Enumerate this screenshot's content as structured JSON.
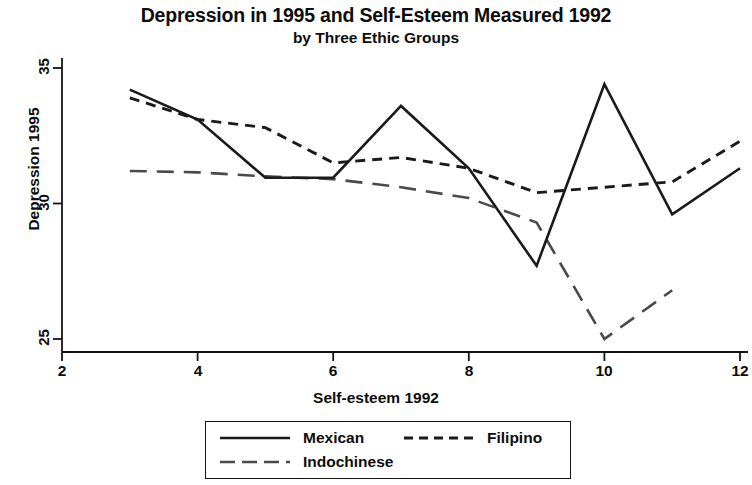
{
  "chart_data": {
    "type": "line",
    "title": "Depression in 1995 and Self-Esteem Measured 1992",
    "subtitle": "by Three Ethic Groups",
    "xlabel": "Self-esteem 1992",
    "ylabel": "Depression 1995",
    "xlim": [
      2,
      12
    ],
    "ylim": [
      24.1,
      35.2
    ],
    "xticks": [
      2,
      4,
      6,
      8,
      10,
      12
    ],
    "yticks": [
      25,
      30,
      35
    ],
    "grid": false,
    "legend_position": "below-axes",
    "series": [
      {
        "name": "Mexican",
        "style": "solid",
        "color": "#1a1a1a",
        "x": [
          3,
          4,
          5,
          6,
          7,
          8,
          9,
          10,
          11,
          12
        ],
        "values": [
          34.2,
          33.1,
          30.95,
          30.95,
          33.6,
          31.3,
          27.7,
          34.4,
          29.6,
          31.3
        ]
      },
      {
        "name": "Filipino",
        "style": "dashed-short",
        "color": "#1a1a1a",
        "x": [
          3,
          4,
          5,
          6,
          7,
          8,
          9,
          10,
          11,
          12
        ],
        "values": [
          33.9,
          33.1,
          32.8,
          31.5,
          31.7,
          31.3,
          30.4,
          30.6,
          30.8,
          32.3
        ]
      },
      {
        "name": "Indochinese",
        "style": "dashed-long",
        "color": "#4a4a4a",
        "x": [
          3,
          4,
          5,
          6,
          7,
          8,
          9,
          10,
          11
        ],
        "values": [
          31.2,
          31.15,
          31.0,
          30.9,
          30.6,
          30.2,
          29.3,
          25.0,
          26.8
        ]
      }
    ],
    "legend": [
      {
        "label": "Mexican",
        "style": "solid"
      },
      {
        "label": "Filipino",
        "style": "dashed-short"
      },
      {
        "label": "Indochinese",
        "style": "dashed-long"
      }
    ]
  },
  "axes": {
    "ytick_labels": [
      "35",
      "30",
      "25"
    ],
    "xtick_labels": [
      "2",
      "4",
      "6",
      "8",
      "10",
      "12"
    ]
  }
}
